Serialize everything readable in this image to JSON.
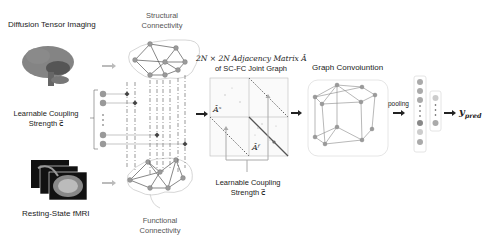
{
  "figure": {
    "inputs": {
      "dti_label": "Diffusion Tensor Imaging",
      "fmri_label": "Resting-State fMRI",
      "coupling_left_label_line1": "Learnable Coupling",
      "coupling_left_label_line2": "Strength c⃗"
    },
    "connectivity": {
      "structural_line1": "Structural",
      "structural_line2": "Connectivity",
      "functional_line1": "Functional",
      "functional_line2": "Connectivity"
    },
    "matrix": {
      "title_line1": "2N × 2N Adjacency Matrix Â",
      "title_line2": "of SC-FC Joint Graph",
      "block_s": "Âˢ",
      "block_f": "Âᶠ",
      "coupling_line1": "Learnable Coupling",
      "coupling_line2": "Strength c⃗"
    },
    "gcn": {
      "title": "Graph Convoiuntion",
      "pooling_label": "pooling"
    },
    "output": {
      "label": "y",
      "subscript": "pred"
    },
    "colors": {
      "node": "#9a9a9a",
      "edge": "#777777",
      "dashed": "#555555",
      "arrow_dark": "#222222",
      "arrow_light": "#bbbbbb"
    }
  }
}
